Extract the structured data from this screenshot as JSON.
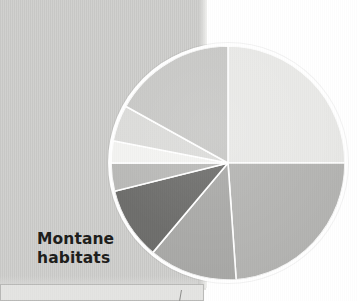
{
  "figure": {
    "caption": "Montane\nhabitats",
    "page_background_color": "#cfcfcd",
    "outer_background_color": "#ffffff"
  },
  "chart_data": {
    "type": "pie",
    "title": "Montane habitats",
    "xlabel": "",
    "ylabel": "",
    "grid": false,
    "legend_position": "none",
    "start_angle_deg": 0,
    "direction": "clockwise",
    "center_px": [
      228,
      163
    ],
    "radius_px": 117,
    "slice_separator_color": "#ffffff",
    "categories": [
      "Segment 1",
      "Segment 2",
      "Segment 3",
      "Segment 4",
      "Segment 5",
      "Segment 6",
      "Segment 7",
      "Segment 8"
    ],
    "values": [
      25,
      24,
      12,
      10,
      4,
      3,
      5,
      17
    ],
    "percentages": [
      25,
      24,
      12,
      10,
      4,
      3,
      5,
      17
    ],
    "colors": [
      "#e9e9e7",
      "#b5b5b3",
      "#aaaaa8",
      "#6e6e6c",
      "#b9b9b7",
      "#f3f3f1",
      "#dcdcda",
      "#c8c8c6"
    ],
    "angles_deg": [
      [
        0,
        90
      ],
      [
        90,
        176
      ],
      [
        176,
        220
      ],
      [
        220,
        256
      ],
      [
        256,
        270
      ],
      [
        270,
        281
      ],
      [
        281,
        299
      ],
      [
        299,
        360
      ]
    ]
  },
  "inset": {
    "visible": true,
    "label": ""
  }
}
